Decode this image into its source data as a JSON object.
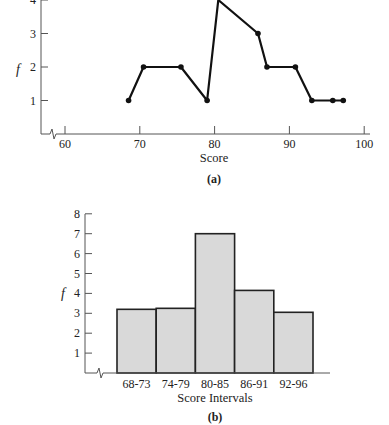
{
  "chart_data": [
    {
      "type": "line",
      "panel": "(a)",
      "title": "",
      "xlabel": "Score",
      "ylabel": "f",
      "xlim": [
        57,
        100
      ],
      "ylim": [
        0,
        4
      ],
      "x_ticks": [
        60,
        70,
        80,
        90,
        100
      ],
      "x_tick_labels": [
        "60",
        "70",
        "80",
        "90",
        "100"
      ],
      "y_ticks": [
        1,
        2,
        3,
        4
      ],
      "y_tick_labels": [
        "1",
        "2",
        "3",
        "4"
      ],
      "axis_break": true,
      "grid": false,
      "legend": null,
      "x": [
        68.5,
        70.5,
        75.5,
        79,
        80.5,
        85.8,
        87,
        90.8,
        93,
        95.8,
        97.2
      ],
      "values": [
        1,
        2,
        2,
        1,
        4,
        3,
        2,
        2,
        1,
        1,
        1
      ]
    },
    {
      "type": "bar",
      "subtype": "histogram",
      "panel": "(b)",
      "title": "",
      "xlabel": "Score Intervals",
      "ylabel": "f",
      "ylim": [
        0,
        8
      ],
      "y_ticks": [
        1,
        2,
        3,
        4,
        5,
        6,
        7,
        8
      ],
      "y_tick_labels": [
        "1",
        "2",
        "3",
        "4",
        "5",
        "6",
        "7",
        "8"
      ],
      "axis_break": true,
      "grid": false,
      "legend": null,
      "bar_color": "#d9d9d9",
      "categories": [
        "68-73",
        "74-79",
        "80-85",
        "86-91",
        "92-96"
      ],
      "values": [
        3.2,
        3.25,
        7,
        4.15,
        3.05
      ]
    }
  ],
  "panels": {
    "a": {
      "label": "(a)",
      "xlabel": "Score",
      "ylabel": "f"
    },
    "b": {
      "label": "(b)",
      "xlabel": "Score Intervals",
      "ylabel": "f"
    }
  }
}
